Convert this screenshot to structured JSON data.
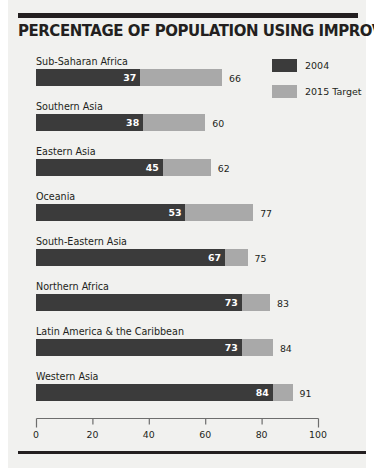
{
  "chart_data": {
    "type": "bar",
    "orientation": "horizontal",
    "title": "PERCENTAGE OF POPULATION USING IMPROVED SANITATION",
    "xlabel": "",
    "ylabel": "",
    "xlim": [
      0,
      100
    ],
    "xticks": [
      "0",
      "20",
      "40",
      "60",
      "80",
      "100"
    ],
    "grid": false,
    "legend_position": "top-right",
    "categories": [
      "Sub-Saharan Africa",
      "Southern Asia",
      "Eastern Asia",
      "Oceania",
      "South-Eastern Asia",
      "Northern Africa",
      "Latin America & the Caribbean",
      "Western Asia"
    ],
    "series": [
      {
        "name": "2004",
        "color": "#3b3b3b",
        "values": [
          37,
          38,
          45,
          53,
          67,
          73,
          73,
          84
        ]
      },
      {
        "name": "2015 Target",
        "color": "#a9a9a9",
        "values": [
          66,
          60,
          62,
          77,
          75,
          83,
          84,
          91
        ]
      }
    ]
  },
  "legend": {
    "items": [
      {
        "label": "2004",
        "swatch": "dark"
      },
      {
        "label": "2015 Target",
        "swatch": "light"
      }
    ]
  },
  "colors": {
    "dark_bar": "#3b3b3b",
    "light_bar": "#a9a9a9",
    "rule": "#231f20",
    "background": "#f1f1ef",
    "text": "#231f20"
  }
}
